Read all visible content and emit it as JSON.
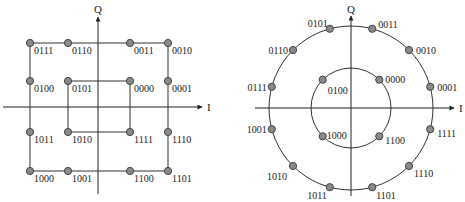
{
  "left_diagram": {
    "title": "Square 16-point constellation (16-QAM style)",
    "axis_x_label": "I",
    "axis_y_label": "Q",
    "points": [
      {
        "code": "0111",
        "x": 30,
        "y": 43
      },
      {
        "code": "0110",
        "x": 68,
        "y": 43
      },
      {
        "code": "0011",
        "x": 130,
        "y": 43
      },
      {
        "code": "0010",
        "x": 168,
        "y": 43
      },
      {
        "code": "0100",
        "x": 30,
        "y": 81
      },
      {
        "code": "0101",
        "x": 68,
        "y": 81
      },
      {
        "code": "0000",
        "x": 130,
        "y": 81
      },
      {
        "code": "0001",
        "x": 168,
        "y": 81
      },
      {
        "code": "1011",
        "x": 30,
        "y": 132
      },
      {
        "code": "1010",
        "x": 68,
        "y": 132
      },
      {
        "code": "1111",
        "x": 130,
        "y": 132
      },
      {
        "code": "1110",
        "x": 168,
        "y": 132
      },
      {
        "code": "1000",
        "x": 30,
        "y": 171
      },
      {
        "code": "1001",
        "x": 68,
        "y": 171
      },
      {
        "code": "1100",
        "x": 130,
        "y": 171
      },
      {
        "code": "1101",
        "x": 168,
        "y": 171
      }
    ]
  },
  "right_diagram": {
    "title": "Circular 16-point constellation (4+12 APSK style)",
    "axis_x_label": "I",
    "axis_y_label": "Q",
    "inner_ring_points": [
      {
        "code": "0000",
        "angle_deg": 45
      },
      {
        "code": "0100",
        "angle_deg": 135
      },
      {
        "code": "1000",
        "angle_deg": 225
      },
      {
        "code": "1100",
        "angle_deg": 315
      }
    ],
    "outer_ring_points": [
      {
        "code": "0001",
        "angle_deg": 15
      },
      {
        "code": "0010",
        "angle_deg": 45
      },
      {
        "code": "0011",
        "angle_deg": 75
      },
      {
        "code": "0101",
        "angle_deg": 105
      },
      {
        "code": "0110",
        "angle_deg": 135
      },
      {
        "code": "0111",
        "angle_deg": 165
      },
      {
        "code": "1001",
        "angle_deg": 195
      },
      {
        "code": "1010",
        "angle_deg": 225
      },
      {
        "code": "1011",
        "angle_deg": 255
      },
      {
        "code": "1101",
        "angle_deg": 285
      },
      {
        "code": "1110",
        "angle_deg": 315
      },
      {
        "code": "1111",
        "angle_deg": 345
      }
    ]
  },
  "colors": {
    "line": "#333333",
    "point_fill": "#8a8a8a",
    "point_stroke": "#444444"
  }
}
